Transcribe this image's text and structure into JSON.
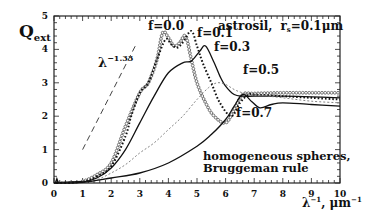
{
  "chart_data": {
    "type": "line",
    "xlabel": "λ⁻¹, μm⁻¹",
    "ylabel": "Q_ext",
    "xlim": [
      0,
      10
    ],
    "ylim": [
      0,
      5
    ],
    "x_ticks": [
      "0",
      "1",
      "2",
      "3",
      "4",
      "5",
      "6",
      "7",
      "8",
      "9",
      "10"
    ],
    "y_ticks": [
      "0",
      "1",
      "2",
      "3",
      "4",
      "5"
    ],
    "grid": false,
    "annotations": {
      "power_law": "λ⁻¹·³³",
      "note_line1": "homogeneous spheres,",
      "note_line2": "Bruggeman rule"
    },
    "series": [
      {
        "name": "f=0.0",
        "style": "open-circles",
        "x": [
          0,
          0.5,
          1,
          1.5,
          2,
          2.5,
          3,
          3.3,
          3.6,
          3.8,
          4.0,
          4.2,
          4.4,
          4.6,
          4.8,
          5.0,
          5.3,
          5.6,
          6.0,
          6.3,
          6.6,
          7,
          8,
          9,
          10
        ],
        "y": [
          0,
          0.02,
          0.05,
          0.25,
          0.6,
          1.7,
          2.7,
          3.0,
          3.7,
          4.5,
          4.35,
          4.1,
          4.2,
          4.4,
          3.7,
          3.0,
          2.4,
          2.0,
          1.8,
          2.2,
          2.65,
          2.68,
          2.7,
          2.7,
          2.7
        ]
      },
      {
        "name": "f=0.1",
        "style": "thick-dotted",
        "x": [
          0,
          1,
          1.5,
          2,
          2.5,
          2.7,
          3,
          3.3,
          3.6,
          3.9,
          4.1,
          4.3,
          4.5,
          4.8,
          5.0,
          5.2,
          5.5,
          5.8,
          6.2,
          6.5,
          6.8,
          7,
          8,
          9,
          10
        ],
        "y": [
          0,
          0.04,
          0.2,
          0.5,
          1.4,
          2.0,
          2.7,
          3.0,
          3.7,
          4.3,
          4.15,
          4.05,
          4.2,
          4.55,
          4.1,
          3.6,
          3.0,
          2.4,
          2.0,
          2.4,
          2.65,
          2.65,
          2.6,
          2.55,
          2.5
        ]
      },
      {
        "name": "f=0.3",
        "style": "solid",
        "x": [
          0,
          1,
          1.5,
          2,
          2.5,
          3,
          3.5,
          4,
          4.5,
          4.8,
          5.1,
          5.3,
          5.6,
          5.8,
          6.0,
          6.3,
          6.6,
          7,
          8,
          9,
          10
        ],
        "y": [
          0,
          0.03,
          0.15,
          0.45,
          1.0,
          1.8,
          2.6,
          3.3,
          3.6,
          3.65,
          3.95,
          4.1,
          3.6,
          3.2,
          2.9,
          2.65,
          2.6,
          2.6,
          2.6,
          2.58,
          2.55
        ]
      },
      {
        "name": "f=0.5",
        "style": "thin-dotted",
        "x": [
          0,
          1,
          1.5,
          2,
          2.5,
          3,
          3.5,
          4,
          4.5,
          5,
          5.4,
          5.7,
          6.0,
          6.3,
          6.6,
          7,
          8,
          9,
          10
        ],
        "y": [
          0,
          0.02,
          0.1,
          0.3,
          0.55,
          0.9,
          1.2,
          1.6,
          2.0,
          2.5,
          2.85,
          3.0,
          2.95,
          2.8,
          2.7,
          2.65,
          2.55,
          2.45,
          2.4
        ]
      },
      {
        "name": "f=0.7",
        "style": "solid",
        "x": [
          0,
          1,
          2,
          3,
          4,
          5,
          5.5,
          6,
          6.3,
          6.6,
          6.9,
          7.2,
          7.6,
          8,
          9,
          10
        ],
        "y": [
          0,
          0.02,
          0.15,
          0.3,
          0.6,
          1.1,
          1.45,
          1.9,
          2.3,
          2.65,
          2.45,
          2.25,
          2.35,
          2.4,
          2.35,
          2.3
        ]
      },
      {
        "name": "λ^-1.33",
        "style": "dashed",
        "x": [
          1.0,
          2.9
        ],
        "y": [
          1.0,
          4.2
        ]
      }
    ]
  },
  "labels": {
    "ylabel_main": "Q",
    "ylabel_sub": "ext",
    "title_material": "astrosil,",
    "title_r": "r",
    "title_r_sub": "s",
    "title_r_val": "=0.1μm",
    "power_base": "λ",
    "power_exp": "−1.33",
    "f00": "f=0.0",
    "f01": "f=0.1",
    "f03": "f=0.3",
    "f05": "f=0.5",
    "f07": "f=0.7",
    "note1": "homogeneous spheres,",
    "note2": "Bruggeman rule",
    "xlabel_base": "λ",
    "xlabel_exp": "−1",
    "xlabel_unit": ", μm",
    "xlabel_unit_exp": "−1"
  }
}
